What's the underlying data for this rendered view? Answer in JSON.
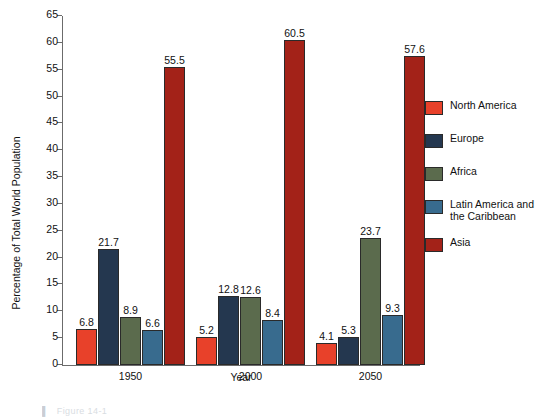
{
  "chart_data": {
    "type": "bar",
    "title": "",
    "xlabel": "Year",
    "ylabel": "Percentage of Total World Population",
    "ylim": [
      0,
      65
    ],
    "ytick_step": 5,
    "yticks": [
      0,
      5,
      10,
      15,
      20,
      25,
      30,
      35,
      40,
      45,
      50,
      55,
      60,
      65
    ],
    "grid": false,
    "legend_position": "right",
    "categories": [
      "1950",
      "2000",
      "2050"
    ],
    "series": [
      {
        "name": "North America",
        "color": "#e8412a",
        "values": [
          6.8,
          5.2,
          4.1
        ]
      },
      {
        "name": "Europe",
        "color": "#24374f",
        "values": [
          21.7,
          12.8,
          5.3
        ]
      },
      {
        "name": "Africa",
        "color": "#5b6b4d",
        "values": [
          8.9,
          12.6,
          23.7
        ]
      },
      {
        "name": "Latin America and\nthe Caribbean",
        "color": "#386b8e",
        "values": [
          6.6,
          8.4,
          9.3
        ]
      },
      {
        "name": "Asia",
        "color": "#a32218",
        "values": [
          55.5,
          60.5,
          57.6
        ]
      }
    ],
    "data_labels": [
      [
        "6.8",
        "21.7",
        "8.9",
        "6.6",
        "55.5"
      ],
      [
        "5.2",
        "12.8",
        "12.6",
        "8.4",
        "60.5"
      ],
      [
        "4.1",
        "5.3",
        "23.7",
        "9.3",
        "57.6"
      ]
    ]
  },
  "legend": {
    "items": [
      {
        "label": "North America",
        "color": "#e8412a"
      },
      {
        "label": "Europe",
        "color": "#24374f"
      },
      {
        "label": "Africa",
        "color": "#5b6b4d"
      },
      {
        "label_line1": "Latin America and",
        "label_line2": "the Caribbean",
        "color": "#386b8e"
      },
      {
        "label": "Asia",
        "color": "#a32218"
      }
    ]
  },
  "axes": {
    "ylabel": "Percentage of Total World Population",
    "xlabel": "Year",
    "ytick_labels": [
      "0",
      "5",
      "10",
      "15",
      "20",
      "25",
      "30",
      "35",
      "40",
      "45",
      "50",
      "55",
      "60",
      "65"
    ],
    "xtick_labels": [
      "1950",
      "2000",
      "2050"
    ]
  },
  "caption": {
    "marker": "▌",
    "text": "Figure 14-1"
  }
}
